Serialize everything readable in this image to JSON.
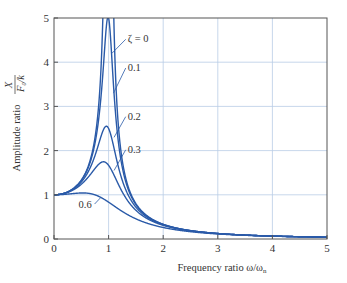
{
  "chart_data": {
    "type": "line",
    "title": "",
    "xlabel": "Frequency ratio ω/ω",
    "xlabel_sub": "n",
    "ylabel": "Amplitude ratio",
    "ylabel_frac_num": "X",
    "ylabel_frac_den": "F",
    "ylabel_frac_den_sub": "0",
    "ylabel_frac_den_tail": "/k",
    "xlim": [
      0,
      5
    ],
    "ylim": [
      0,
      5
    ],
    "x_ticks": [
      "0",
      "1",
      "2",
      "3",
      "4",
      "5"
    ],
    "y_ticks": [
      "0",
      "1",
      "2",
      "3",
      "4",
      "5"
    ],
    "grid": true,
    "formula": "X/(F0/k) = 1/sqrt((1-r^2)^2 + (2*zeta*r)^2)",
    "series": [
      {
        "name": "ζ = 0",
        "zeta": 0,
        "x": [
          0,
          0.5,
          0.8,
          0.9,
          1.1,
          1.2,
          1.5,
          2,
          3,
          4,
          5
        ],
        "values": [
          1,
          1.33,
          2.78,
          5.26,
          4.76,
          2.27,
          0.8,
          0.33,
          0.125,
          0.067,
          0.042
        ]
      },
      {
        "name": "0.1",
        "zeta": 0.1,
        "x": [
          0,
          0.5,
          0.8,
          0.9,
          1.0,
          1.1,
          1.2,
          1.5,
          2,
          3,
          4,
          5
        ],
        "values": [
          1,
          1.32,
          2.58,
          4.03,
          5.0,
          3.82,
          2.13,
          0.79,
          0.33,
          0.125,
          0.067,
          0.042
        ]
      },
      {
        "name": "0.2",
        "zeta": 0.2,
        "x": [
          0,
          0.5,
          0.8,
          0.96,
          1.0,
          1.2,
          1.5,
          2,
          3,
          4,
          5
        ],
        "values": [
          1,
          1.3,
          2.16,
          2.55,
          2.5,
          1.75,
          0.74,
          0.32,
          0.124,
          0.066,
          0.042
        ]
      },
      {
        "name": "0.3",
        "zeta": 0.3,
        "x": [
          0,
          0.5,
          0.8,
          0.9,
          1.0,
          1.2,
          1.5,
          2,
          3,
          4,
          5
        ],
        "values": [
          1,
          1.26,
          1.72,
          1.75,
          1.67,
          1.29,
          0.68,
          0.31,
          0.122,
          0.066,
          0.041
        ]
      },
      {
        "name": "0.6",
        "zeta": 0.6,
        "x": [
          0,
          0.5,
          0.8,
          1.0,
          1.2,
          1.5,
          2,
          3,
          4,
          5
        ],
        "values": [
          1,
          1.0,
          0.97,
          0.83,
          0.67,
          0.47,
          0.26,
          0.115,
          0.064,
          0.041
        ]
      }
    ],
    "annotations": [
      {
        "text": "ζ = 0",
        "x": 1.35,
        "y": 4.45
      },
      {
        "text": "0.1",
        "x": 1.35,
        "y": 3.8
      },
      {
        "text": "0.2",
        "x": 1.35,
        "y": 2.7
      },
      {
        "text": "0.3",
        "x": 1.35,
        "y": 1.95
      },
      {
        "text": "0.6",
        "x": 0.45,
        "y": 0.7
      }
    ]
  }
}
